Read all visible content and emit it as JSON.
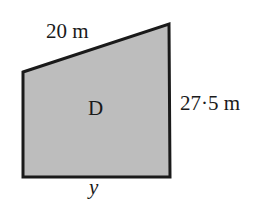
{
  "diagram": {
    "shape": {
      "type": "trapezium",
      "name": "D",
      "vertices": [
        [
          23,
          72
        ],
        [
          169,
          24
        ],
        [
          170,
          177
        ],
        [
          23,
          177
        ]
      ],
      "fill": "#bdbdbd",
      "stroke": "#1a1a1a"
    },
    "labels": {
      "top_edge": "20 m",
      "right_edge": "27·5 m",
      "center": "D",
      "bottom_edge": "y"
    }
  }
}
